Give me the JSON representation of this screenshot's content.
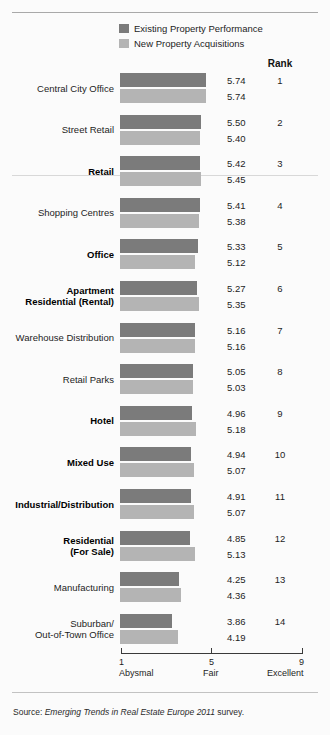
{
  "legend": {
    "items": [
      {
        "label": "Existing Property Performance",
        "color": "#7b7b7b",
        "swatch": "dark-swatch-icon"
      },
      {
        "label": "New Property Acquisitions",
        "color": "#b4b4b4",
        "swatch": "light-swatch-icon"
      }
    ]
  },
  "rank_header": "Rank",
  "axis": {
    "ticks": [
      {
        "num": "1",
        "word": "Abysmal"
      },
      {
        "num": "5",
        "word": "Fair"
      },
      {
        "num": "9",
        "word": "Excellent"
      }
    ]
  },
  "source": {
    "prefix": "Source:",
    "italic": "Emerging Trends in Real Estate Europe 2011",
    "suffix": "survey."
  },
  "chart_data": {
    "type": "bar",
    "title": "",
    "xlabel": "",
    "ylabel": "",
    "xlim": [
      1,
      9
    ],
    "grid": false,
    "orientation": "horizontal",
    "legend_position": "top",
    "categories": [
      "Central City Office",
      "Street Retail",
      "Retail",
      "Shopping Centres",
      "Office",
      "Apartment Residential (Rental)",
      "Warehouse Distribution",
      "Retail Parks",
      "Hotel",
      "Mixed Use",
      "Industrial/Distribution",
      "Residential (For Sale)",
      "Manufacturing",
      "Suburban/Out-of-Town Office"
    ],
    "category_lines": [
      [
        "Central City Office"
      ],
      [
        "Street Retail"
      ],
      [
        "Retail"
      ],
      [
        "Shopping Centres"
      ],
      [
        "Office"
      ],
      [
        "Apartment",
        "Residential (Rental)"
      ],
      [
        "Warehouse Distribution"
      ],
      [
        "Retail Parks"
      ],
      [
        "Hotel"
      ],
      [
        "Mixed Use"
      ],
      [
        "Industrial/Distribution"
      ],
      [
        "Residential",
        "(For Sale)"
      ],
      [
        "Manufacturing"
      ],
      [
        "Suburban/",
        "Out-of-Town Office"
      ]
    ],
    "category_bold": [
      false,
      false,
      true,
      false,
      true,
      true,
      false,
      false,
      true,
      true,
      true,
      true,
      false,
      false
    ],
    "series": [
      {
        "name": "Existing Property Performance",
        "color": "#7b7b7b",
        "values": [
          5.74,
          5.5,
          5.42,
          5.41,
          5.33,
          5.27,
          5.16,
          5.05,
          4.96,
          4.94,
          4.91,
          4.85,
          4.25,
          3.86
        ]
      },
      {
        "name": "New Property Acquisitions",
        "color": "#b4b4b4",
        "values": [
          5.74,
          5.4,
          5.45,
          5.38,
          5.12,
          5.35,
          5.16,
          5.03,
          5.18,
          5.07,
          5.07,
          5.13,
          4.36,
          4.19
        ]
      }
    ],
    "ranks": [
      1,
      2,
      3,
      4,
      5,
      6,
      7,
      8,
      9,
      10,
      11,
      12,
      13,
      14
    ]
  }
}
